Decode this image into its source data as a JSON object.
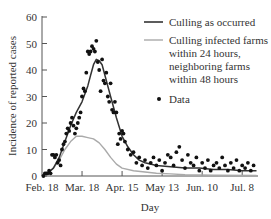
{
  "chart_data": {
    "type": "line",
    "title": "",
    "xlabel": "Day",
    "ylabel": "Incidence of reported cases",
    "ylim": [
      0,
      60
    ],
    "yticks": [
      0,
      10,
      20,
      30,
      40,
      50,
      60
    ],
    "xtick_labels": [
      "Feb. 18",
      "Mar. 18",
      "Apr. 15",
      "May 13",
      "Jun. 10",
      "Jul. 8"
    ],
    "xtick_days": [
      0,
      28,
      56,
      84,
      112,
      140
    ],
    "xlim_days": [
      0,
      150
    ],
    "grid": false,
    "legend_position": "upper right",
    "legend": [
      {
        "label": "Culling as occurred",
        "style": "dark-line",
        "color": "#333333"
      },
      {
        "label_lines": [
          "Culling infected farms",
          "within 24 hours,",
          "neighboring farms",
          "within 48 hours"
        ],
        "style": "light-line",
        "color": "#aaaaaa"
      },
      {
        "label": "Data",
        "style": "dot",
        "color": "#111111"
      }
    ],
    "series": [
      {
        "name": "Culling as occurred",
        "color": "#333333",
        "x": [
          0,
          4,
          8,
          12,
          16,
          20,
          24,
          28,
          32,
          34,
          36,
          38,
          40,
          42,
          44,
          48,
          52,
          56,
          60,
          64,
          68,
          72,
          80,
          90,
          100,
          110,
          120,
          130,
          140,
          150
        ],
        "y": [
          0,
          1,
          3,
          7,
          13,
          19,
          24,
          28,
          34,
          38,
          42,
          44,
          43.5,
          42,
          38,
          30,
          22,
          15,
          11,
          8,
          6,
          5,
          4,
          3.5,
          3,
          3,
          2.5,
          2.5,
          2,
          2
        ]
      },
      {
        "name": "Culling infected farms within 24 hours, neighboring farms within 48 hours",
        "color": "#aaaaaa",
        "x": [
          0,
          4,
          8,
          12,
          16,
          20,
          24,
          28,
          32,
          36,
          40,
          44,
          48,
          52,
          56,
          64,
          72,
          80,
          90,
          100,
          120,
          150
        ],
        "y": [
          0,
          1,
          3,
          6,
          10,
          13,
          15,
          15,
          14.5,
          14,
          12.5,
          10,
          7,
          4.5,
          3,
          2,
          1.5,
          1,
          0.8,
          0.5,
          0.3,
          0.2
        ]
      },
      {
        "name": "Data",
        "type": "scatter",
        "color": "#111111",
        "x": [
          1,
          2,
          3,
          4,
          5,
          6,
          7,
          8,
          9,
          10,
          11,
          12,
          13,
          14,
          15,
          16,
          17,
          18,
          19,
          20,
          21,
          22,
          23,
          24,
          25,
          26,
          27,
          28,
          29,
          30,
          31,
          32,
          33,
          34,
          35,
          36,
          37,
          38,
          39,
          40,
          41,
          42,
          43,
          44,
          45,
          46,
          47,
          48,
          49,
          50,
          51,
          52,
          53,
          54,
          55,
          56,
          57,
          58,
          60,
          62,
          64,
          66,
          68,
          70,
          72,
          74,
          76,
          78,
          80,
          82,
          84,
          86,
          88,
          90,
          92,
          94,
          96,
          98,
          100,
          102,
          104,
          106,
          108,
          110,
          112,
          114,
          116,
          118,
          120,
          122,
          124,
          126,
          128,
          130,
          132,
          134,
          136,
          138,
          140,
          142,
          144,
          146,
          148
        ],
        "y": [
          0,
          1,
          1,
          1,
          2,
          1,
          8,
          8,
          7,
          8,
          5,
          6,
          4,
          10,
          12,
          13,
          16,
          18,
          17,
          20,
          22,
          19,
          16,
          18,
          20,
          22,
          24,
          30,
          33,
          32,
          39,
          47,
          46,
          47,
          49,
          48,
          47,
          51,
          43,
          40,
          32,
          44,
          36,
          35,
          39,
          30,
          28,
          35,
          25,
          24,
          28,
          24,
          12,
          16,
          14,
          17,
          16,
          13,
          10,
          8,
          9,
          5,
          7,
          4,
          6,
          3,
          5,
          7,
          4,
          6,
          2,
          5,
          8,
          7,
          4,
          9,
          11,
          6,
          3,
          8,
          5,
          4,
          7,
          2,
          5,
          3,
          6,
          2,
          4,
          5,
          3,
          7,
          4,
          2,
          5,
          3,
          6,
          2,
          4,
          3,
          5,
          2,
          4
        ]
      }
    ]
  },
  "axes": {
    "ylabel": "Incidence of reported cases",
    "xlabel": "Day",
    "yticks": [
      "0",
      "10",
      "20",
      "30",
      "40",
      "50",
      "60"
    ],
    "xticks": [
      "Feb. 18",
      "Mar. 18",
      "Apr. 15",
      "May 13",
      "Jun. 10",
      "Jul. 8"
    ]
  },
  "legend": {
    "item1": "Culling as occurred",
    "item2_line1": "Culling infected farms",
    "item2_line2": "within 24 hours,",
    "item2_line3": "neighboring farms",
    "item2_line4": "within 48 hours",
    "item3": "Data"
  }
}
